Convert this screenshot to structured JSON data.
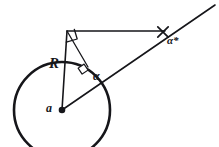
{
  "figure": {
    "kind": "geometry-diagram",
    "background_color": "#ffffff",
    "stroke_color": "#16161a",
    "width": 219,
    "height": 147
  },
  "labels": {
    "radius": "R",
    "center": "a",
    "angle_inner": "α",
    "angle_outer": "α*"
  },
  "geometry": {
    "circle": {
      "center_x": 62,
      "center_y": 110,
      "radius": 48,
      "stroke_width": 2.6,
      "fill": "none"
    },
    "center_dot": {
      "x": 62,
      "y": 110,
      "r": 3.2
    },
    "radius_segment": {
      "x1": 62,
      "y1": 110,
      "x2": 67,
      "y2": 31,
      "stroke_width": 1.5
    },
    "tangent_segment": {
      "x1": 67,
      "y1": 31,
      "x2": 165,
      "y2": 31,
      "stroke_width": 1.3
    },
    "ray_from_center": {
      "x1": 62,
      "y1": 110,
      "x2": 215,
      "y2": 5,
      "stroke_width": 1.5
    },
    "perpendicular_segment": {
      "x1": 67,
      "y1": 31,
      "x2": 88,
      "y2": 67,
      "stroke_width": 1.3
    },
    "right_angle_top": {
      "x": 67,
      "y": 31,
      "size": 11
    },
    "right_angle_mid": {
      "x": 84,
      "y": 70,
      "size": 7
    },
    "cross_marker": {
      "x": 163,
      "y": 32,
      "size": 5.5,
      "stroke_width": 1.6
    }
  }
}
